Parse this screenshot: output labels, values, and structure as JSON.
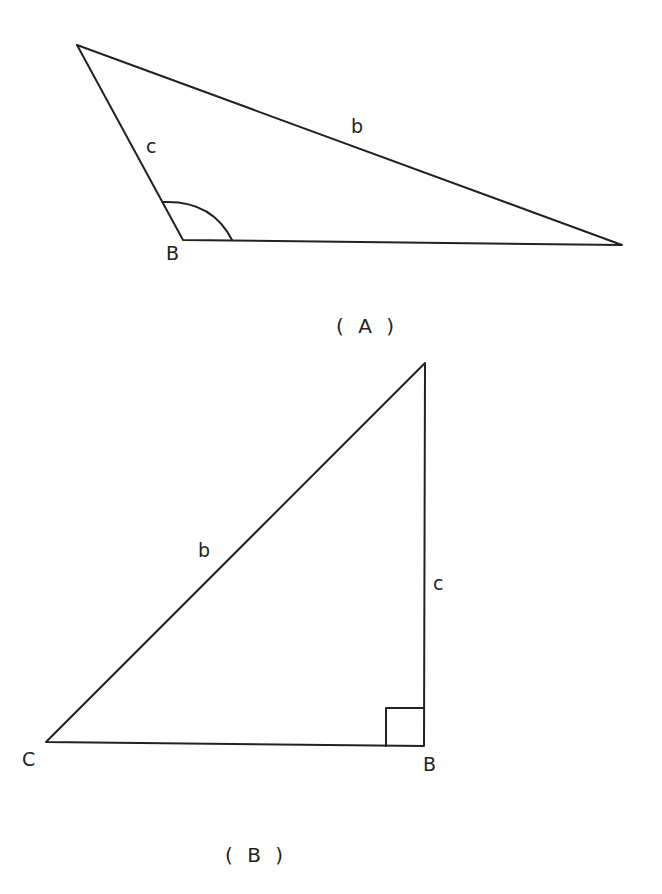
{
  "figure_a": {
    "caption": "( A )",
    "vertices": {
      "top": [
        77,
        45
      ],
      "B": [
        183,
        240
      ],
      "right": [
        622,
        245
      ]
    },
    "labels": {
      "side_c": "c",
      "side_b": "b",
      "vertex_B": "B"
    },
    "angle_mark": "obtuse angle arc at B"
  },
  "figure_b": {
    "caption": "( B )",
    "vertices": {
      "top": [
        425,
        363
      ],
      "C": [
        46,
        742
      ],
      "B": [
        424,
        746
      ]
    },
    "labels": {
      "side_b": "b",
      "side_c": "c",
      "vertex_C": "C",
      "vertex_B": "B"
    },
    "angle_mark": "right angle square at B"
  },
  "colors": {
    "line": "#222222",
    "background": "#ffffff"
  }
}
